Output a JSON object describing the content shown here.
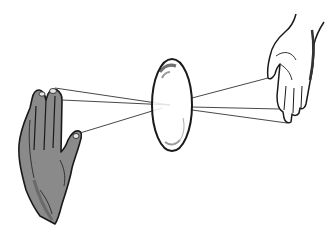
{
  "illustration": {
    "description": "Line illustration of two hands holding threads that pass through an oval lens or soap film",
    "colors": {
      "background": "#ffffff",
      "ink": "#1a1a1a",
      "left_hand_shade": "#8a8a8a",
      "left_hand_dark": "#555555",
      "right_hand_fill": "#ffffff",
      "thread": "#333333"
    },
    "lens": {
      "cx": 172,
      "cy": 105,
      "rx": 20,
      "ry": 46
    },
    "threads_left": [
      {
        "x1": 55,
        "y1": 88,
        "x2": 170,
        "y2": 105
      },
      {
        "x1": 62,
        "y1": 100,
        "x2": 170,
        "y2": 105
      },
      {
        "x1": 80,
        "y1": 133,
        "x2": 162,
        "y2": 108
      }
    ],
    "threads_right": [
      {
        "x1": 192,
        "y1": 98,
        "x2": 268,
        "y2": 78
      },
      {
        "x1": 192,
        "y1": 107,
        "x2": 279,
        "y2": 109
      },
      {
        "x1": 192,
        "y1": 110,
        "x2": 287,
        "y2": 123
      }
    ]
  }
}
